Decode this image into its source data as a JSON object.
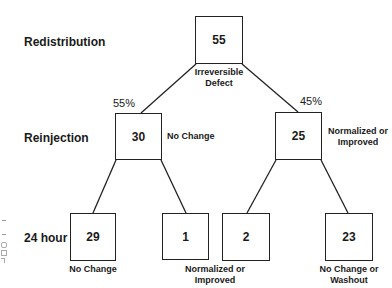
{
  "row_labels": {
    "redistribution": "Redistribution",
    "reinjection": "Reinjection",
    "hour24": "24 hour"
  },
  "nodes": {
    "root": {
      "value": "55",
      "caption_line1": "Irreversible",
      "caption_line2": "Defect"
    },
    "reinj_left": {
      "value": "30",
      "caption": "No Change",
      "branch_pct": "55%"
    },
    "reinj_right": {
      "value": "25",
      "caption_line1": "Normalized or",
      "caption_line2": "Improved",
      "branch_pct": "45%"
    },
    "h24_1": {
      "value": "29",
      "caption": "No Change"
    },
    "h24_2": {
      "value": "1"
    },
    "h24_3": {
      "value": "2"
    },
    "h24_4": {
      "value": "23",
      "caption_line1": "No Change or",
      "caption_line2": "Washout"
    },
    "shared_caption": {
      "line1": "Normalized or",
      "line2": "Improved"
    }
  }
}
